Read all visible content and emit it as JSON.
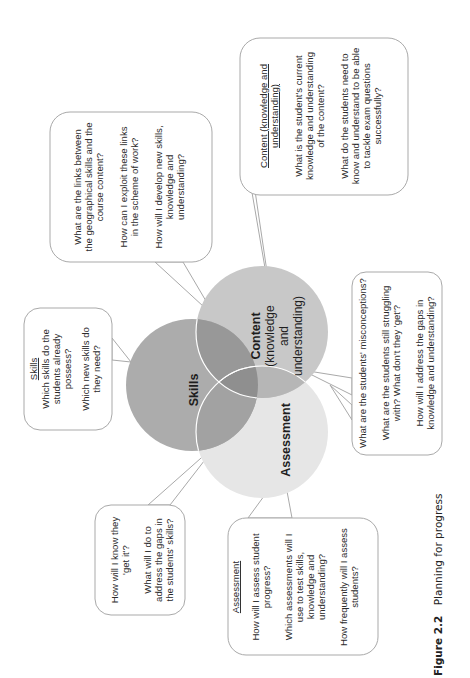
{
  "diagram": {
    "orientation": "rotated 90 degrees counter-clockwise",
    "circles": [
      {
        "id": "skills",
        "label": "Skills",
        "color": "#a9a9a9"
      },
      {
        "id": "content",
        "label": "Content",
        "sub": [
          "(knowledge",
          "and",
          "understanding)"
        ],
        "color": "#c6c6c6"
      },
      {
        "id": "assessment",
        "label": "Assessment",
        "color": "#e4e4e4"
      }
    ],
    "overlap_colors": {
      "skills_content": "#959595",
      "skills_assessment": "#9f9f9f",
      "content_assessment": "#b4b4b4",
      "center": "#8d8d8d"
    },
    "bubbles": {
      "links": {
        "lines": [
          "What are the links between",
          "the geographical skills and the",
          "course content?",
          "",
          "How can I exploit these links",
          "in the scheme of work?",
          "",
          "How will I develop new skills,",
          "knowledge and",
          "understanding?"
        ]
      },
      "content": {
        "heading": [
          "Content (knowledge and",
          "understanding)"
        ],
        "lines": [
          "What is the student's current",
          "knowledge and understanding",
          "of the content?",
          "",
          "What do the students need to",
          "know and understand to be able",
          "to tackle exam questions",
          "successfully?"
        ]
      },
      "skills": {
        "heading": [
          "Skills"
        ],
        "lines": [
          "Which skills do the",
          "students already",
          "possess?",
          "",
          "Which new skills do",
          "they need?"
        ]
      },
      "misconceptions": {
        "lines": [
          "What are the students' misconceptions?",
          "",
          "What are the students still struggling",
          "with? What don't they 'get'?",
          "",
          "How will I address the gaps in",
          "knowledge and understanding?"
        ]
      },
      "get_it": {
        "lines": [
          "How will I know they",
          "'get it'?",
          "",
          "What will I do to",
          "address the gaps in",
          "the students' skills?"
        ]
      },
      "assessment": {
        "heading": [
          "Assessment"
        ],
        "lines": [
          "How will I assess student",
          "progress?",
          "",
          "Which assessments will I",
          "use to test skills,",
          "knowledge and",
          "understanding?",
          "",
          "How frequently will I assess",
          "students?"
        ]
      }
    }
  },
  "caption": {
    "label": "Figure 2.2",
    "title": "Planning for progress"
  }
}
